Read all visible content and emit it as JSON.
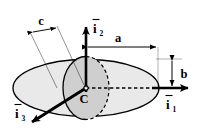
{
  "figure": {
    "background_color": "#ffffff",
    "stroke_color": "#000000",
    "outer_ellipse_fill": "#e9e9e9",
    "inner_ellipse_fill": "#cfcfcf"
  },
  "axes": [
    {
      "id": "i1",
      "letter": "i",
      "subscript": "1",
      "overbar": true,
      "label": "ī₁",
      "direction": "right"
    },
    {
      "id": "i2",
      "letter": "i",
      "subscript": "2",
      "overbar": true,
      "label": "ī₂",
      "direction": "up"
    },
    {
      "id": "i3",
      "letter": "i",
      "subscript": "3",
      "overbar": true,
      "label": "ī₃",
      "direction": "down-left"
    }
  ],
  "dimensions": [
    {
      "id": "a",
      "label": "a",
      "orientation": "horizontal",
      "description": "semi-axis along i1"
    },
    {
      "id": "b",
      "label": "b",
      "orientation": "vertical",
      "description": "semi-axis along i2"
    },
    {
      "id": "c",
      "label": "c",
      "orientation": "oblique",
      "description": "semi-axis along i3"
    }
  ],
  "points": [
    {
      "id": "center",
      "label": "C",
      "description": "center of the ellipsoid"
    }
  ]
}
